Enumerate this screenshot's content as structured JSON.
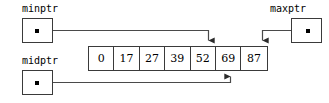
{
  "diagram": {
    "line_color": "#4a4a4a",
    "box_color": "#3a3a3a",
    "text_color": "#000000",
    "background": "#ffffff"
  },
  "pointers": [
    {
      "id": "minptr",
      "label": "minptr",
      "target_index": 4,
      "target_value": "52",
      "arrow_direction": "down"
    },
    {
      "id": "maxptr",
      "label": "maxptr",
      "target_index": 6,
      "target_value": "87",
      "arrow_direction": "down"
    },
    {
      "id": "midptr",
      "label": "midptr",
      "target_index": 5,
      "target_value": "69",
      "arrow_direction": "up"
    }
  ],
  "array": {
    "name": "sorted-array",
    "cells": [
      "0",
      "17",
      "27",
      "39",
      "52",
      "69",
      "87"
    ]
  }
}
